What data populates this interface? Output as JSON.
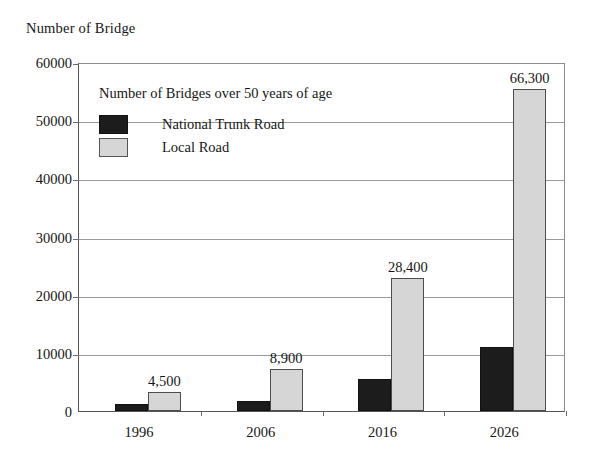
{
  "axis_title": "Number of Bridge",
  "legend": {
    "title": "Number of Bridges over 50 years of age",
    "entries": [
      {
        "label": "National Trunk Road",
        "color": "#1c1c1c",
        "swatch": "black-square-icon"
      },
      {
        "label": "Local Road",
        "color": "#d6d6d6",
        "swatch": "gray-square-icon"
      }
    ]
  },
  "chart_data": {
    "type": "bar",
    "title": "Number of Bridges over 50 years of age",
    "subtitle": "",
    "xlabel": "",
    "ylabel": "Number of Bridge",
    "categories": [
      "1996",
      "2006",
      "2016",
      "2026"
    ],
    "tick_labels": [
      "0",
      "10000",
      "20000",
      "30000",
      "40000",
      "50000",
      "60000"
    ],
    "ticks": [
      0,
      10000,
      20000,
      30000,
      40000,
      50000,
      60000
    ],
    "ylim": [
      0,
      60000
    ],
    "grid": true,
    "legend_position": "inside-top-left",
    "series": [
      {
        "name": "National Trunk Road",
        "color": "#1c1c1c",
        "values": [
          1200,
          1700,
          5500,
          11000
        ]
      },
      {
        "name": "Local Road",
        "color": "#d6d6d6",
        "values": [
          3300,
          7200,
          22900,
          55300
        ]
      }
    ],
    "annotations": [
      {
        "category": "1996",
        "text": "4,500",
        "value": 4500
      },
      {
        "category": "2006",
        "text": "8,900",
        "value": 8900
      },
      {
        "category": "2016",
        "text": "28,400",
        "value": 28400
      },
      {
        "category": "2026",
        "text": "66,300",
        "value": 66300
      }
    ]
  }
}
